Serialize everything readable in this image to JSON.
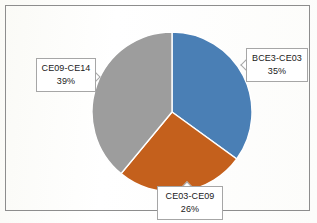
{
  "chart_data": {
    "type": "pie",
    "title": "",
    "categories": [
      "BCE3-CE03",
      "CE03-CE09",
      "CE09-CE14"
    ],
    "values": [
      35,
      26,
      39
    ],
    "value_unit": "%",
    "labels": [
      {
        "name": "BCE3-CE03",
        "percent": "35%",
        "value": 35,
        "color": "#4a7fb5",
        "position": "right"
      },
      {
        "name": "CE03-CE09",
        "percent": "26%",
        "value": 26,
        "color": "#c4601c",
        "position": "bottom"
      },
      {
        "name": "CE09-CE14",
        "percent": "39%",
        "value": 39,
        "color": "#9d9d9d",
        "position": "left"
      }
    ],
    "start_angle_deg": 0,
    "direction": "clockwise",
    "legend": "none",
    "grid": false,
    "data_labels": "category-name-and-percentage",
    "colors": {
      "slice_blue": "#4a7fb5",
      "slice_orange": "#c4601c",
      "slice_gray": "#9d9d9d",
      "frame_border": "#8d8d8d",
      "callout_border": "#a6a6a6",
      "background": "#fdfdfb"
    }
  },
  "chart": {
    "frame_name": "chart-area-frame",
    "plot_name": "pie-plot"
  }
}
